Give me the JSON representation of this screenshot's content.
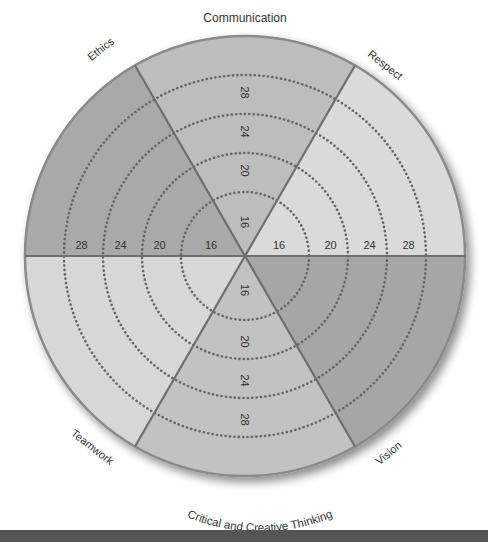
{
  "diagram": {
    "type": "segmented-wheel",
    "center": [
      245,
      256
    ],
    "radius": 221,
    "ring_values": [
      "16",
      "20",
      "24",
      "28"
    ],
    "ring_radii": [
      64,
      103,
      142,
      181
    ],
    "segments": [
      {
        "id": "respect",
        "label": "Respect",
        "start_angle": 0,
        "end_angle": 60,
        "color": "#dadada",
        "scale_axis": true
      },
      {
        "id": "communication",
        "label": "Communication",
        "start_angle": 60,
        "end_angle": 120,
        "color": "#bdbdbd",
        "scale_axis": true
      },
      {
        "id": "ethics",
        "label": "Ethics",
        "start_angle": 120,
        "end_angle": 180,
        "color": "#a9a9a9",
        "scale_axis": true
      },
      {
        "id": "teamwork",
        "label": "Teamwork",
        "start_angle": 180,
        "end_angle": 240,
        "color": "#d7d7d7",
        "scale_axis": false
      },
      {
        "id": "critical-creative-thinking",
        "label": "Critical and Creative Thinking",
        "start_angle": 240,
        "end_angle": 300,
        "color": "#c2c2c2",
        "scale_axis": true
      },
      {
        "id": "vision",
        "label": "Vision",
        "start_angle": 300,
        "end_angle": 360,
        "color": "#a6a6a6",
        "scale_axis": false
      }
    ],
    "labels": {
      "communication": "Communication",
      "respect": "Respect",
      "ethics": "Ethics",
      "teamwork": "Teamwork",
      "vision": "Vision",
      "critical_creative": "Critical and Creative Thinking"
    },
    "colors": {
      "divider": "#6e6e6e",
      "dots": "#666666",
      "rim": "#8a8a8a",
      "bottom_bar": "#555555"
    }
  }
}
